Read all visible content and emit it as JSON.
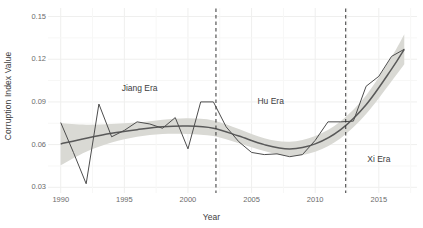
{
  "chart_data": {
    "type": "line",
    "title": "",
    "xlabel": "Year",
    "ylabel": "Corruption Index Value",
    "xlim": [
      1989,
      2018
    ],
    "ylim": [
      0.026,
      0.156
    ],
    "grid": true,
    "legend": "none",
    "x_ticks": [
      "1990",
      "1995",
      "2000",
      "2005",
      "2010",
      "2015"
    ],
    "x_tick_values": [
      1990,
      1995,
      2000,
      2005,
      2010,
      2015
    ],
    "y_ticks": [
      "0.03",
      "0.06",
      "0.09",
      "0.12",
      "0.15"
    ],
    "y_tick_values": [
      0.03,
      0.06,
      0.09,
      0.12,
      0.15
    ],
    "series": [
      {
        "name": "Corruption Index Value",
        "type": "line",
        "color": "#4d4d4d",
        "x": [
          1990,
          1991,
          1992,
          1993,
          1994,
          1995,
          1996,
          1997,
          1998,
          1999,
          2000,
          2001,
          2002,
          2003,
          2004,
          2005,
          2006,
          2007,
          2008,
          2009,
          2010,
          2011,
          2012,
          2013,
          2014,
          2015,
          2016,
          2017
        ],
        "values": [
          0.0755,
          0.0545,
          0.0325,
          0.0885,
          0.0655,
          0.07,
          0.076,
          0.0745,
          0.0715,
          0.079,
          0.057,
          0.09,
          0.09,
          0.0725,
          0.062,
          0.0545,
          0.053,
          0.0535,
          0.0515,
          0.053,
          0.063,
          0.076,
          0.076,
          0.0765,
          0.101,
          0.108,
          0.122,
          0.127
        ]
      },
      {
        "name": "Smoothed trend (loess)",
        "type": "line",
        "color": "#595959",
        "x": [
          1990,
          1992,
          1994,
          1996,
          1998,
          2000,
          2002,
          2004,
          2006,
          2008,
          2010,
          2012,
          2014,
          2016,
          2017
        ],
        "values": [
          0.0605,
          0.0645,
          0.068,
          0.0705,
          0.0725,
          0.073,
          0.0715,
          0.066,
          0.06,
          0.057,
          0.0605,
          0.0705,
          0.088,
          0.113,
          0.127
        ]
      },
      {
        "name": "Confidence band (95%)",
        "type": "area",
        "color": "#d9d9d4",
        "x": [
          1990,
          1992,
          1994,
          1996,
          1998,
          2000,
          2002,
          2004,
          2006,
          2008,
          2010,
          2012,
          2014,
          2016,
          2017
        ],
        "upper": [
          0.075,
          0.074,
          0.0745,
          0.0755,
          0.0775,
          0.0785,
          0.077,
          0.071,
          0.0645,
          0.062,
          0.066,
          0.0765,
          0.0945,
          0.1215,
          0.1375
        ],
        "lower": [
          0.0455,
          0.055,
          0.0615,
          0.0655,
          0.0675,
          0.0675,
          0.066,
          0.061,
          0.0555,
          0.052,
          0.055,
          0.0645,
          0.0815,
          0.1045,
          0.1165
        ]
      }
    ],
    "vertical_markers": [
      {
        "label": "era-divider-jiang-hu",
        "x": 2002.2,
        "style": "dashed",
        "color": "#333333"
      },
      {
        "label": "era-divider-hu-xi",
        "x": 2012.4,
        "style": "dashed",
        "color": "#333333"
      }
    ],
    "annotations": [
      {
        "text": "Jiang Era",
        "x": 1996.2,
        "y": 0.0995
      },
      {
        "text": "Hu Era",
        "x": 2006.5,
        "y": 0.0905
      },
      {
        "text": "Xi Era",
        "x": 2015.0,
        "y": 0.05
      }
    ]
  }
}
